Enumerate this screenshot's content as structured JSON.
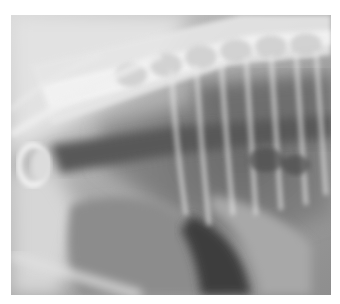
{
  "image": {
    "type": "radiograph",
    "view": "lateral thorax",
    "palette": {
      "background": "#ffffff",
      "bone": "#ededed",
      "soft_tissue": "#a8a8a8",
      "air": "#5a5a5a",
      "dark": "#3c3c3c"
    }
  }
}
